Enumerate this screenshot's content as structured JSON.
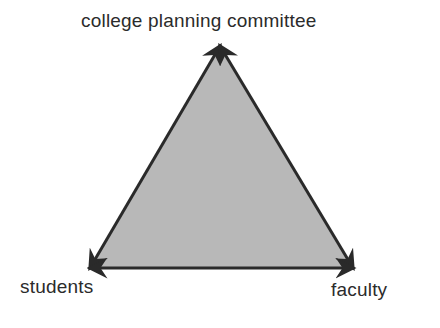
{
  "diagram": {
    "type": "triangle-relationship",
    "nodes": [
      {
        "id": "top",
        "label": "college planning committee"
      },
      {
        "id": "left",
        "label": "students"
      },
      {
        "id": "right",
        "label": "faculty"
      }
    ],
    "edges": [
      {
        "from": "top",
        "to": "left",
        "style": "double-arrow"
      },
      {
        "from": "top",
        "to": "right",
        "style": "double-arrow"
      },
      {
        "from": "left",
        "to": "right",
        "style": "double-arrow"
      }
    ],
    "colors": {
      "fill": "#b8b8b8",
      "stroke": "#2a2a2a",
      "text": "#2b2b2b"
    }
  }
}
